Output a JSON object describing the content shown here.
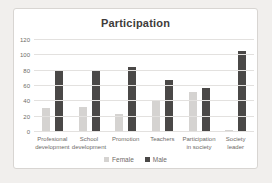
{
  "colors": {
    "page_bg": "#f1efed",
    "chart_bg": "#ffffff",
    "border": "#d8d5d2",
    "gridline": "#e3e1df",
    "text": "#6e6b68",
    "title_color": "#3e3c3a"
  },
  "chart_data": {
    "type": "bar",
    "title": "Participation",
    "categories": [
      "Profesional development",
      "School development",
      "Promotion",
      "Teachers",
      "Participation in society",
      "Society leader"
    ],
    "series": [
      {
        "name": "Female",
        "color": "#d5d3d1",
        "values": [
          31,
          32,
          24,
          41,
          52,
          2
        ]
      },
      {
        "name": "Male",
        "color": "#4a4847",
        "values": [
          80,
          79,
          85,
          68,
          57,
          106
        ]
      }
    ],
    "xlabel": "",
    "ylabel": "",
    "ylim": [
      0,
      120
    ],
    "yticks": [
      0,
      20,
      40,
      60,
      80,
      100,
      120
    ],
    "grid": true,
    "legend_position": "bottom"
  }
}
